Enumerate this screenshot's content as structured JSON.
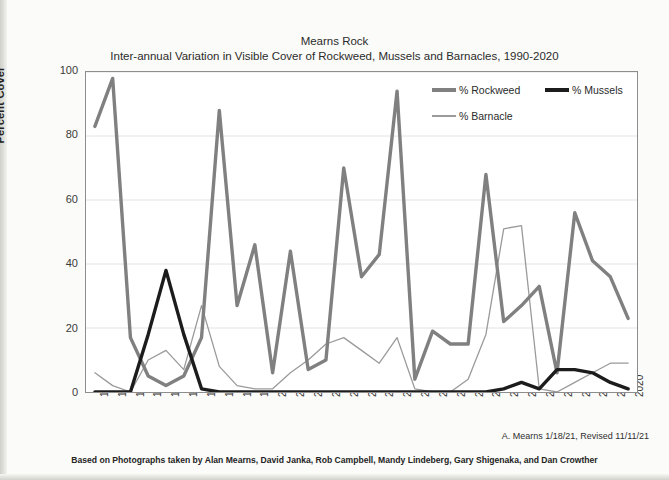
{
  "chart_data": {
    "type": "line",
    "title": "Mearns Rock",
    "subtitle": "Inter-annual Variation in Visible Cover of Rockweed, Mussels and Barnacles, 1990-2020",
    "xlabel": "",
    "ylabel": "Percent Cover",
    "ylim": [
      0,
      100
    ],
    "yticks": [
      0,
      20,
      40,
      60,
      80,
      100
    ],
    "grid": "horizontal",
    "legend_position": "top-right-inside",
    "categories": [
      "1990",
      "1991",
      "1992",
      "1993",
      "1994",
      "1995",
      "1996",
      "1997",
      "1998",
      "1999",
      "2000",
      "2001",
      "2002",
      "2003",
      "2004",
      "2005",
      "2006",
      "2007",
      "2008",
      "2009",
      "2010",
      "2011",
      "2012",
      "2013",
      "2014",
      "2015",
      "2016",
      "2017",
      "2018",
      "2019",
      "2020"
    ],
    "series": [
      {
        "name": "% Rockweed",
        "color": "#808080",
        "width": 3.4,
        "values": [
          83,
          98,
          17,
          5,
          2,
          5,
          17,
          88,
          27,
          46,
          6,
          44,
          7,
          10,
          70,
          36,
          43,
          94,
          4,
          19,
          15,
          15,
          68,
          22,
          27,
          33,
          6,
          56,
          41,
          36,
          23
        ]
      },
      {
        "name": "% Mussels",
        "color": "#1c1c1c",
        "width": 3.4,
        "values": [
          0,
          0,
          0,
          18,
          38,
          18,
          1,
          0,
          0,
          0,
          0,
          0,
          0,
          0,
          0,
          0,
          0,
          0,
          0,
          0,
          0,
          0,
          0,
          1,
          3,
          1,
          7,
          7,
          6,
          3,
          1
        ]
      },
      {
        "name": "% Barnacle",
        "color": "#9a9a9a",
        "width": 1.3,
        "values": [
          6,
          2,
          0,
          10,
          13,
          7,
          27,
          8,
          2,
          1,
          1,
          6,
          10,
          15,
          17,
          13,
          9,
          17,
          1,
          0,
          0,
          4,
          18,
          51,
          52,
          1,
          0,
          3,
          6,
          9,
          9
        ]
      }
    ],
    "annotations": {
      "credit": "A. Mearns 1/18/21, Revised 11/11/21",
      "source_note": "Based on Photographs taken by Alan Mearns, David Janka, Rob Campbell, Mandy Lindeberg, Gary Shigenaka, and Dan Crowther"
    }
  }
}
